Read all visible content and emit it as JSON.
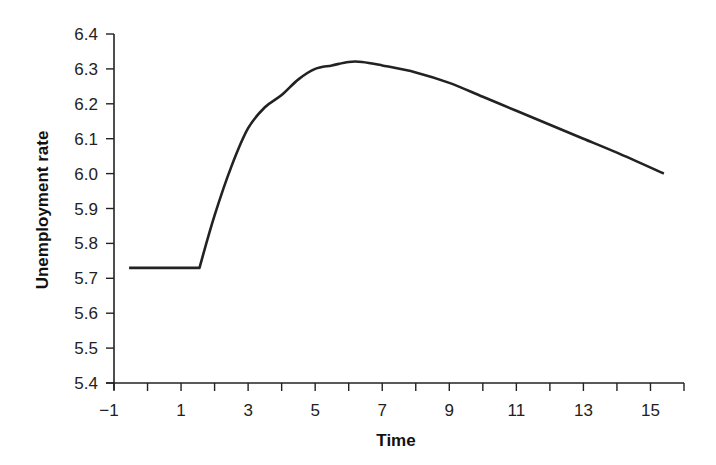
{
  "chart_data": {
    "type": "line",
    "title": "",
    "xlabel": "Time",
    "ylabel": "Unemployment rate",
    "xlim": [
      -1,
      16
    ],
    "ylim": [
      5.4,
      6.4
    ],
    "x_ticks": [
      -1,
      0,
      1,
      2,
      3,
      4,
      5,
      6,
      7,
      8,
      9,
      10,
      11,
      12,
      13,
      14,
      15,
      16
    ],
    "x_tick_labels": [
      "−1",
      "1",
      "3",
      "5",
      "7",
      "9",
      "11",
      "13",
      "15"
    ],
    "x_tick_label_values": [
      -1,
      1,
      3,
      5,
      7,
      9,
      11,
      13,
      15
    ],
    "y_ticks": [
      5.4,
      5.5,
      5.6,
      5.7,
      5.8,
      5.9,
      6.0,
      6.1,
      6.2,
      6.3,
      6.4
    ],
    "y_tick_labels": [
      "5.4",
      "5.5",
      "5.6",
      "5.7",
      "5.8",
      "5.9",
      "6.0",
      "6.1",
      "6.2",
      "6.3",
      "6.4"
    ],
    "grid": false,
    "legend": null,
    "series": [
      {
        "name": "Unemployment rate",
        "color": "#222222",
        "x": [
          -0.55,
          1.55,
          2.0,
          2.5,
          3.0,
          3.5,
          4.0,
          4.5,
          5.0,
          5.5,
          6.0,
          6.4,
          7.0,
          8.0,
          9.0,
          10.0,
          11.0,
          12.0,
          13.0,
          14.0,
          15.4
        ],
        "values": [
          5.73,
          5.73,
          5.88,
          6.02,
          6.13,
          6.19,
          6.225,
          6.27,
          6.3,
          6.31,
          6.32,
          6.32,
          6.31,
          6.29,
          6.26,
          6.22,
          6.18,
          6.14,
          6.1,
          6.06,
          6.0
        ]
      }
    ]
  }
}
